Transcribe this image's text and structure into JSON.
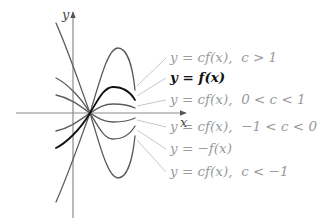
{
  "diagram": {
    "axes": {
      "x_label": "x",
      "y_label": "y",
      "axis_color": "#8a8a8a"
    },
    "intersection_point": [
      90,
      113
    ],
    "curves": [
      {
        "id": "c-greater-1",
        "label": "y = cf(x),  c > 1",
        "stroke": "#5a5a5a",
        "label_color": "#9a9a9a",
        "width": 1.3,
        "path": "M56,202 C70,170 80,140 90,113 C100,80 108,48 118,48 C128,48 133,70 135,90",
        "leader": [
          [
            137,
            86
          ],
          [
            166,
            58
          ]
        ],
        "label_pos": [
          170,
          62
        ]
      },
      {
        "id": "f",
        "label": "y = f(x)",
        "stroke": "#111111",
        "label_color": "#111111",
        "width": 1.8,
        "path": "M56,148 C66,143 80,130 90,113 C98,100 104,87 113,87 C124,87 131,93 135,100",
        "leader": [
          [
            137,
            96
          ],
          [
            166,
            78
          ]
        ],
        "label_pos": [
          170,
          82
        ]
      },
      {
        "id": "c-between-0-1",
        "label": "y = cf(x),  0 < c < 1",
        "stroke": "#5a5a5a",
        "label_color": "#9a9a9a",
        "width": 1.3,
        "path": "M56,131 C70,128 80,120 90,113 C98,108 104,104 113,104 C124,104 131,106 135,108",
        "leader": [
          [
            137,
            106
          ],
          [
            166,
            100
          ]
        ],
        "label_pos": [
          170,
          104
        ]
      },
      {
        "id": "c-between-neg1-0",
        "label": "y = cf(x),  −1 < c < 0",
        "stroke": "#5a5a5a",
        "label_color": "#9a9a9a",
        "width": 1.3,
        "path": "M56,95 C70,98 80,106 90,113 C98,118 104,122 113,122 C124,122 131,120 135,118",
        "leader": [
          [
            137,
            120
          ],
          [
            166,
            127
          ]
        ],
        "label_pos": [
          170,
          131
        ]
      },
      {
        "id": "neg-f",
        "label": "y = −f(x)",
        "stroke": "#5a5a5a",
        "label_color": "#9a9a9a",
        "width": 1.3,
        "path": "M56,78 C66,83 80,96 90,113 C98,126 104,139 113,139 C124,139 131,133 135,126",
        "leader": [
          [
            137,
            130
          ],
          [
            166,
            149
          ]
        ],
        "label_pos": [
          170,
          153
        ]
      },
      {
        "id": "c-less-neg1",
        "label": "y = cf(x),  c < −1",
        "stroke": "#5a5a5a",
        "label_color": "#9a9a9a",
        "width": 1.3,
        "path": "M56,23 C70,55 80,86 90,113 C100,146 108,178 118,178 C128,178 133,156 135,136",
        "leader": [
          [
            137,
            140
          ],
          [
            166,
            172
          ]
        ],
        "label_pos": [
          170,
          176
        ]
      }
    ]
  },
  "labels": {
    "c_gt_1": {
      "y": "y",
      "eq": " = ",
      "rhs": "cf(x),",
      "cond": "  c > 1"
    },
    "f": {
      "y": "y",
      "eq": " = ",
      "rhs": "f(x)",
      "cond": ""
    },
    "c_0_1": {
      "y": "y",
      "eq": " = ",
      "rhs": "cf(x),",
      "cond": "  0 < c < 1"
    },
    "c_neg1_0": {
      "y": "y",
      "eq": " = ",
      "rhs": "cf(x),",
      "cond": "  −1 < c < 0"
    },
    "neg_f": {
      "y": "y",
      "eq": " = ",
      "rhs": "−f(x)",
      "cond": ""
    },
    "c_lt_neg1": {
      "y": "y",
      "eq": " = ",
      "rhs": "cf(x),",
      "cond": "  c < −1"
    }
  }
}
